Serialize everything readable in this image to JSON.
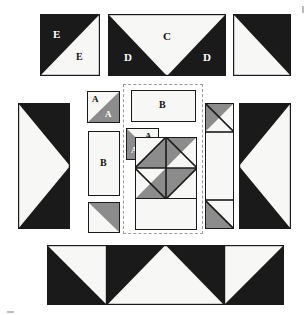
{
  "diagram": {
    "kind": "patchwork-unit-layout",
    "colors": {
      "dark": "#1a1a1a",
      "medium": "#8c8c8c",
      "light": "#f7f7f5",
      "outline": "#1a1a1a",
      "dashed_guide": "#9a9a9a",
      "background": "#ffffff"
    },
    "labels": {
      "a": "A",
      "b": "B",
      "c": "C",
      "d": "D",
      "e": "E"
    },
    "legend_note": "Pieces labelled A (small medium/light triangles), B (light rectangles), C (light flying-goose triangle), D (dark side triangles), E (dark and light half-square triangles).",
    "units": [
      {
        "id": "top-left-e-square",
        "name": "E half-square triangle",
        "type": "half-square-triangle",
        "row": "top",
        "labels": [
          "E",
          "E"
        ]
      },
      {
        "id": "top-center-cd-geese",
        "name": "C / D flying geese",
        "type": "flying-geese",
        "row": "top",
        "labels": [
          "C",
          "D",
          "D"
        ]
      },
      {
        "id": "top-right-hst",
        "name": "dark half-square triangle",
        "type": "half-square-triangle",
        "row": "top",
        "labels": []
      },
      {
        "id": "left-geese-vertical",
        "name": "vertical flying geese left",
        "type": "flying-geese-vertical",
        "row": "middle",
        "labels": []
      },
      {
        "id": "a-unit-top",
        "name": "A half-square triangle upper",
        "type": "half-square-triangle",
        "row": "middle",
        "labels": [
          "A",
          "A"
        ]
      },
      {
        "id": "b-rect-vertical",
        "name": "B rectangle vertical",
        "type": "rectangle",
        "row": "middle",
        "labels": [
          "B"
        ]
      },
      {
        "id": "small-medium-hst",
        "name": "medium half-square triangle",
        "type": "half-square-triangle",
        "row": "middle",
        "labels": []
      },
      {
        "id": "b-rect-horizontal",
        "name": "B rectangle horizontal",
        "type": "rectangle",
        "row": "center-block",
        "labels": [
          "B"
        ]
      },
      {
        "id": "a-unit-center",
        "name": "A half-square triangle center",
        "type": "half-square-triangle",
        "row": "center-block",
        "labels": [
          "A",
          "A"
        ]
      },
      {
        "id": "pinwheel",
        "name": "pinwheel four-patch",
        "type": "pinwheel",
        "row": "center-block",
        "labels": []
      },
      {
        "id": "light-rect-under-pinwheel",
        "name": "light background rectangle",
        "type": "rectangle",
        "row": "center-block",
        "labels": []
      },
      {
        "id": "narrow-strip-right",
        "name": "narrow sashing strip with corner triangles",
        "type": "strip",
        "row": "middle",
        "labels": []
      },
      {
        "id": "right-geese-vertical",
        "name": "vertical flying geese right",
        "type": "flying-geese-vertical",
        "row": "middle",
        "labels": []
      },
      {
        "id": "bottom-left-hst",
        "name": "bottom left half-square triangle",
        "type": "half-square-triangle",
        "row": "bottom",
        "labels": []
      },
      {
        "id": "bottom-center-geese",
        "name": "bottom flying geese",
        "type": "flying-geese",
        "row": "bottom",
        "labels": []
      },
      {
        "id": "bottom-right-hst",
        "name": "bottom right half-square triangle",
        "type": "half-square-triangle",
        "row": "bottom",
        "labels": []
      }
    ]
  }
}
